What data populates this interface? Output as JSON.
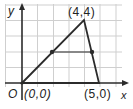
{
  "figure": {
    "type": "coordinate-geometry-diagram",
    "axes": {
      "x_label": "x",
      "y_label": "y",
      "origin_label": "O"
    },
    "grid": {
      "spacing_units": 1,
      "x_range": [
        0,
        6
      ],
      "y_range": [
        0,
        4
      ]
    },
    "triangle": {
      "vertices": [
        {
          "name": "origin",
          "coords": [
            0,
            0
          ],
          "label": "(0,0)"
        },
        {
          "name": "apex",
          "coords": [
            4,
            4
          ],
          "label": "(4,4)"
        },
        {
          "name": "right-vertex",
          "coords": [
            5,
            0
          ],
          "label": "(5,0)"
        }
      ]
    },
    "midsegment": {
      "endpoints": [
        [
          2,
          2
        ],
        [
          4.5,
          2
        ]
      ]
    },
    "colors": {
      "line": "#2b2b2b",
      "grid": "#cfcfcf",
      "background": "#ffffff"
    }
  }
}
